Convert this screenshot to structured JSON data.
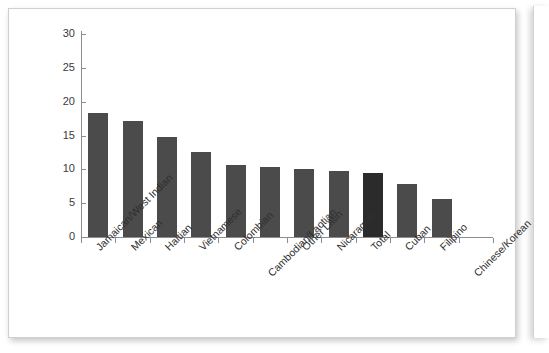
{
  "chart_data": {
    "type": "bar",
    "title": "",
    "subtitle": "",
    "xlabel": "",
    "ylabel": "",
    "ylim": [
      0,
      30
    ],
    "yticks": [
      0,
      5,
      10,
      15,
      20,
      25,
      30
    ],
    "ytick_labels": [
      "0",
      "5",
      "10",
      "15",
      "20",
      "25",
      "30"
    ],
    "grid": false,
    "legend": "none",
    "categories": [
      "Jamaican/West Indian",
      "Mexican",
      "Haitian",
      "Vietnamese",
      "Colombian",
      "Cambodian/Laotian",
      "Other Latin",
      "Nicaraguan",
      "Total",
      "Cuban",
      "Filipino",
      "Chinese/Korean"
    ],
    "values": [
      18.3,
      17.1,
      14.8,
      12.5,
      10.6,
      10.4,
      10.0,
      9.7,
      9.4,
      7.9,
      5.6,
      0
    ],
    "highlighted_category": "Total",
    "bar_color": "#4b4b4b",
    "highlight_color": "#2b2b2b",
    "axis_color": "#8c8c8c",
    "background_color": "#ffffff"
  }
}
